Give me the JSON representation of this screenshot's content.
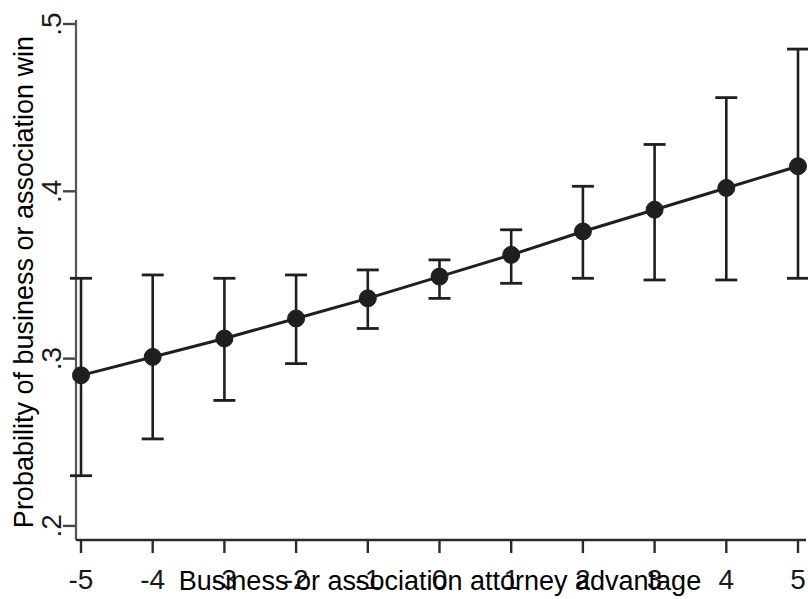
{
  "chart_data": {
    "type": "line",
    "title": "",
    "xlabel": "Business or association attorney advantage",
    "ylabel": "Probability of business or association win",
    "x": [
      -5,
      -4,
      -3,
      -2,
      -1,
      0,
      1,
      2,
      3,
      4,
      5
    ],
    "xtick_labels": [
      "-5",
      "-4",
      "-3",
      "-2",
      "-1",
      "0",
      "1",
      "2",
      "3",
      "4",
      "5"
    ],
    "ytick_labels": [
      ".5",
      ".4",
      ".3",
      ".2"
    ],
    "ytick_values": [
      0.5,
      0.4,
      0.3,
      0.2
    ],
    "xlim": [
      -5.35,
      5.35
    ],
    "ylim": [
      0.2,
      0.5
    ],
    "grid": false,
    "legend": null,
    "series": [
      {
        "name": "Predicted probability",
        "marker": "filled-circle",
        "color": "#1f1f1f",
        "values": [
          0.29,
          0.301,
          0.312,
          0.324,
          0.336,
          0.349,
          0.362,
          0.376,
          0.389,
          0.402,
          0.415
        ],
        "error_bars": {
          "style": "capped-vertical",
          "lower": [
            0.23,
            0.252,
            0.275,
            0.297,
            0.318,
            0.336,
            0.345,
            0.348,
            0.347,
            0.347,
            0.348
          ],
          "upper": [
            0.348,
            0.35,
            0.348,
            0.35,
            0.353,
            0.359,
            0.377,
            0.403,
            0.428,
            0.456,
            0.485
          ]
        }
      }
    ]
  },
  "axes": {
    "x_axis_name": "x-axis",
    "y_axis_name": "y-axis"
  }
}
